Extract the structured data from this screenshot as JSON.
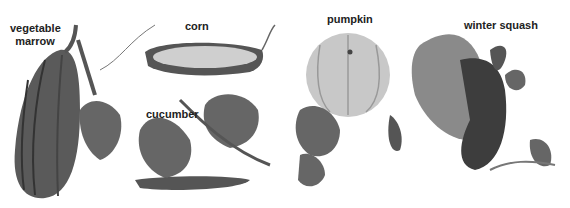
{
  "labels": {
    "marrow": "vegetable\nmarrow",
    "marrow_line1": "vegetable",
    "marrow_line2": "marrow",
    "corn": "corn",
    "cucumber": "cucumber",
    "pumpkin": "pumpkin",
    "winter_squash": "winter squash"
  },
  "colors": {
    "background": "#ffffff",
    "ink": "#222222",
    "dark_gray": "#4a4a4a",
    "mid_gray": "#777777",
    "light_gray": "#bdbdbd",
    "pale": "#d9d9d9"
  }
}
